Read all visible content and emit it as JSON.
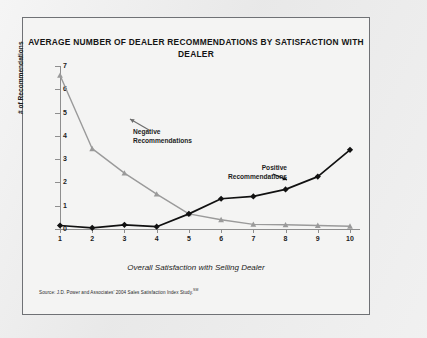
{
  "chart_data": {
    "type": "line",
    "title": "AVERAGE NUMBER OF DEALER RECOMMENDATIONS BY SATISFACTION WITH DEALER",
    "xlabel": "Overall Satisfaction with Selling Dealer",
    "ylabel": "# of Recommendations",
    "x": [
      1,
      2,
      3,
      4,
      5,
      6,
      7,
      8,
      9,
      10
    ],
    "xtick_labels": [
      "1",
      "2",
      "3",
      "4",
      "5",
      "6",
      "7",
      "8",
      "9",
      "10"
    ],
    "ytick_labels": [
      "0",
      "1",
      "2",
      "3",
      "4",
      "5",
      "6",
      "7"
    ],
    "ylim": [
      0,
      7
    ],
    "xlim": [
      1,
      10
    ],
    "grid": false,
    "legend_position": "inline-annotations",
    "series": [
      {
        "name": "Negative Recommendations",
        "color": "#9a9a9a",
        "marker": "triangle",
        "values": [
          6.6,
          3.45,
          2.4,
          1.5,
          0.65,
          0.4,
          0.2,
          0.18,
          0.15,
          0.12
        ]
      },
      {
        "name": "Positive Recommendations",
        "color": "#111111",
        "marker": "diamond",
        "values": [
          0.15,
          0.05,
          0.18,
          0.1,
          0.65,
          1.3,
          1.4,
          1.7,
          2.25,
          3.4
        ]
      }
    ],
    "annotations": [
      {
        "text_line1": "Negative",
        "text_line2": "Recommendations"
      },
      {
        "text_line1": "Positive",
        "text_line2": "Recommendations"
      }
    ]
  },
  "source": {
    "text": "Source: J.D. Power and Associates' 2004 Sales Satisfaction Index Study.",
    "superscript": "SM"
  }
}
